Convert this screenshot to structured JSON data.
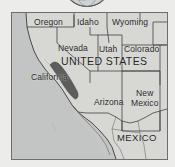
{
  "image": {
    "kind": "reference-map-thumbnail",
    "width": 175,
    "height": 167,
    "background_color": "#ececeb"
  },
  "globe": {
    "name": "globe-graphic",
    "description": "partially cropped globe icon at top edge",
    "ocean_color": "#cfd2d3",
    "land_color": "#9a9a97",
    "outline_color": "#6b6b6b"
  },
  "map": {
    "frame_color": "#6d6d6d",
    "land_color": "#d7d7d4",
    "water_color": "#c3c5c4",
    "border_color": "#4a4a4a",
    "highlight_color": "#5d5d5b",
    "highlight_name": "central-valley-highlight",
    "title": "Southwestern United States and northern Mexico",
    "countries": [
      {
        "id": "united-states",
        "label": "UNITED STATES",
        "x": 60,
        "y": 56
      },
      {
        "id": "mexico",
        "label": "MEXICO",
        "x": 117,
        "y": 132
      }
    ],
    "states": [
      {
        "id": "oregon",
        "label": "Oregon",
        "x": 33,
        "y": 17
      },
      {
        "id": "idaho",
        "label": "Idaho",
        "x": 76,
        "y": 17
      },
      {
        "id": "wyoming",
        "label": "Wyoming",
        "x": 111,
        "y": 17
      },
      {
        "id": "nevada",
        "label": "Nevada",
        "x": 57,
        "y": 43
      },
      {
        "id": "utah",
        "label": "Utah",
        "x": 98,
        "y": 44
      },
      {
        "id": "colorado",
        "label": "Colorado",
        "x": 123,
        "y": 44
      },
      {
        "id": "california",
        "label": "California",
        "x": 30,
        "y": 72
      },
      {
        "id": "arizona",
        "label": "Arizona",
        "x": 93,
        "y": 97
      },
      {
        "id": "new-mexico",
        "label_line1": "New",
        "label_line2": "Mexico",
        "x": 130,
        "y": 88
      }
    ]
  }
}
